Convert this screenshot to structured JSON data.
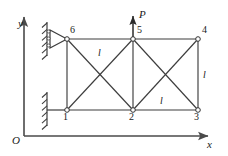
{
  "figure": {
    "type": "truss-diagram",
    "colors": {
      "member": "#3d3d3d",
      "axis": "#4a4a4a",
      "node_fill": "#ffffff",
      "node_stroke": "#333333",
      "text": "#1a1a1a"
    },
    "axes": {
      "x_label": "x",
      "y_label": "y",
      "origin_label": "O"
    },
    "load": {
      "label": "P",
      "direction": "up",
      "at_node": "5"
    },
    "nodes": [
      {
        "id": "1",
        "label": "1",
        "x": 67,
        "y": 110,
        "label_dx": -4,
        "label_dy": 12
      },
      {
        "id": "2",
        "label": "2",
        "x": 133,
        "y": 110,
        "label_dx": -4,
        "label_dy": 12
      },
      {
        "id": "3",
        "label": "3",
        "x": 198,
        "y": 110,
        "label_dx": -4,
        "label_dy": 12
      },
      {
        "id": "4",
        "label": "4",
        "x": 198,
        "y": 39,
        "label_dx": 4,
        "label_dy": -4
      },
      {
        "id": "5",
        "label": "5",
        "x": 133,
        "y": 39,
        "label_dx": 4,
        "label_dy": -4
      },
      {
        "id": "6",
        "label": "6",
        "x": 67,
        "y": 39,
        "label_dx": 3,
        "label_dy": -4
      }
    ],
    "members": [
      {
        "name": "bottom-chord-1-2",
        "from": "1",
        "to": "2"
      },
      {
        "name": "bottom-chord-2-3",
        "from": "2",
        "to": "3"
      },
      {
        "name": "top-chord-6-5",
        "from": "6",
        "to": "5"
      },
      {
        "name": "top-chord-5-4",
        "from": "5",
        "to": "4"
      },
      {
        "name": "vertical-1-6",
        "from": "1",
        "to": "6"
      },
      {
        "name": "vertical-2-5",
        "from": "2",
        "to": "5"
      },
      {
        "name": "vertical-3-4",
        "from": "3",
        "to": "4"
      },
      {
        "name": "diagonal-1-5",
        "from": "1",
        "to": "5"
      },
      {
        "name": "diagonal-6-2",
        "from": "6",
        "to": "2"
      },
      {
        "name": "diagonal-2-4",
        "from": "2",
        "to": "4"
      },
      {
        "name": "diagonal-5-3",
        "from": "5",
        "to": "3"
      }
    ],
    "length_labels": [
      {
        "name": "length-top-left-panel",
        "text": "l",
        "x": 98,
        "y": 48
      },
      {
        "name": "length-bottom-right-panel",
        "text": "l",
        "x": 160,
        "y": 96
      },
      {
        "name": "length-right-vertical",
        "text": "l",
        "x": 203,
        "y": 70
      }
    ],
    "supports": [
      {
        "name": "pin-support-node-6",
        "at_node": "6",
        "kind": "pin-hatched"
      },
      {
        "name": "fixed-support-node-1",
        "at_node": "1",
        "kind": "fixed-hatched"
      }
    ]
  }
}
